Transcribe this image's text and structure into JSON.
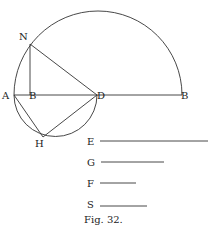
{
  "figure": {
    "caption": "Fig. 32.",
    "points": {
      "A": {
        "label": "A",
        "x": 14,
        "y": 95
      },
      "N": {
        "label": "N",
        "x": 30,
        "y": 44
      },
      "Bfoot": {
        "label": "B",
        "x": 31,
        "y": 95
      },
      "D": {
        "label": "D",
        "x": 97,
        "y": 95
      },
      "H": {
        "label": "H",
        "x": 43,
        "y": 137
      },
      "B": {
        "label": "B",
        "x": 182,
        "y": 95
      }
    },
    "segments": [
      {
        "label": "E",
        "x1": 100,
        "x2": 208,
        "y": 141
      },
      {
        "label": "G",
        "x1": 101,
        "x2": 164,
        "y": 162
      },
      {
        "label": "F",
        "x1": 100,
        "x2": 136,
        "y": 183
      },
      {
        "label": "S",
        "x1": 100,
        "x2": 147,
        "y": 206
      }
    ]
  }
}
